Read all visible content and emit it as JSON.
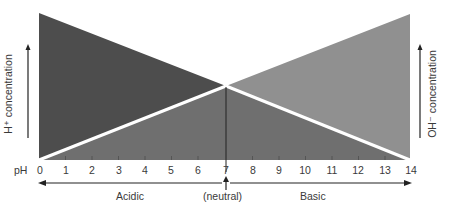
{
  "diagram": {
    "axis_label": "pH",
    "ticks": [
      "0",
      "1",
      "2",
      "3",
      "4",
      "5",
      "6",
      "7",
      "8",
      "9",
      "10",
      "11",
      "12",
      "13",
      "14"
    ],
    "left_label": "H⁺ concentration",
    "right_label": "OH⁻ concentration",
    "region_left": "Acidic",
    "region_center": "(neutral)",
    "region_right": "Basic",
    "colors": {
      "h_triangle": "#4a4a4a",
      "oh_triangle": "#8e8e8e",
      "lower_fill": "#6b6b6b",
      "divider": "#ffffff"
    }
  }
}
